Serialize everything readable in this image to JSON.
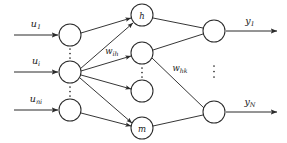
{
  "diagram": {
    "type": "neural-network",
    "stroke_color": "#2b2b2b",
    "text_color": "#1a1a1a",
    "background": "#ffffff"
  },
  "layers": {
    "input": {
      "name": "input-layer",
      "nodes": [
        {
          "id": "in-1",
          "label": "",
          "cx": 70,
          "cy": 35,
          "r": 11
        },
        {
          "id": "in-i",
          "label": "",
          "cx": 70,
          "cy": 72,
          "r": 11
        },
        {
          "id": "in-n",
          "label": "",
          "cx": 70,
          "cy": 110,
          "r": 11
        }
      ],
      "signals": [
        {
          "base": "u",
          "sub": "1",
          "text": "u1",
          "x": 36,
          "y": 24
        },
        {
          "base": "u",
          "sub": "i",
          "text": "ui",
          "x": 36,
          "y": 61
        },
        {
          "base": "u",
          "sub": "ni",
          "text": "uni",
          "x": 36,
          "y": 99
        }
      ],
      "ellipses": [
        {
          "x": 70,
          "y": 53
        },
        {
          "x": 70,
          "y": 91
        }
      ]
    },
    "hidden": {
      "name": "hidden-layer",
      "nodes": [
        {
          "id": "hid-h",
          "label": "h",
          "cx": 142,
          "cy": 15,
          "r": 11
        },
        {
          "id": "hid-2",
          "label": "",
          "cx": 142,
          "cy": 53,
          "r": 11
        },
        {
          "id": "hid-3",
          "label": "",
          "cx": 142,
          "cy": 91,
          "r": 11
        },
        {
          "id": "hid-m",
          "label": "m",
          "cx": 142,
          "cy": 128,
          "r": 11
        }
      ],
      "ellipses": [
        {
          "x": 142,
          "y": 72
        }
      ]
    },
    "output": {
      "name": "output-layer",
      "nodes": [
        {
          "id": "out-1",
          "label": "",
          "cx": 214,
          "cy": 31,
          "r": 11
        },
        {
          "id": "out-N",
          "label": "",
          "cx": 214,
          "cy": 112,
          "r": 11
        }
      ],
      "signals": [
        {
          "base": "y",
          "sub": "1",
          "text": "y1",
          "x": 250,
          "y": 22
        },
        {
          "base": "y",
          "sub": "N",
          "text": "yN",
          "x": 250,
          "y": 100
        }
      ],
      "ellipses": [
        {
          "x": 214,
          "y": 72
        }
      ]
    }
  },
  "weights": [
    {
      "id": "w-ih",
      "base": "w",
      "sub": "ih",
      "text": "wih",
      "x": 112,
      "y": 51
    },
    {
      "id": "w-hk",
      "base": "w",
      "sub": "hk",
      "text": "whk",
      "x": 180,
      "y": 68
    }
  ],
  "input_arrows": [
    {
      "id": "arrow-u1",
      "x1": 14,
      "y1": 35,
      "x2": 58,
      "y2": 35
    },
    {
      "id": "arrow-ui",
      "x1": 14,
      "y1": 72,
      "x2": 58,
      "y2": 72
    },
    {
      "id": "arrow-uni",
      "x1": 14,
      "y1": 110,
      "x2": 58,
      "y2": 110
    }
  ],
  "output_arrows": [
    {
      "id": "arrow-y1",
      "x1": 226,
      "y1": 31,
      "x2": 277,
      "y2": 31
    },
    {
      "id": "arrow-yN",
      "x1": 226,
      "y1": 112,
      "x2": 277,
      "y2": 112
    }
  ],
  "connections": [
    {
      "id": "edge-in1-h",
      "from": "in-1",
      "to": "hid-h",
      "x1": 81,
      "y1": 33,
      "x2": 131,
      "y2": 18,
      "arrow": true
    },
    {
      "id": "edge-ini-h",
      "from": "in-i",
      "to": "hid-h",
      "x1": 80,
      "y1": 69,
      "x2": 133,
      "y2": 22,
      "arrow": true
    },
    {
      "id": "edge-ini-2",
      "from": "in-i",
      "to": "hid-2",
      "x1": 81,
      "y1": 71,
      "x2": 131,
      "y2": 56,
      "arrow": true
    },
    {
      "id": "edge-ini-3",
      "from": "in-i",
      "to": "hid-3",
      "x1": 81,
      "y1": 75,
      "x2": 131,
      "y2": 89,
      "arrow": true
    },
    {
      "id": "edge-ini-m",
      "from": "in-i",
      "to": "hid-m",
      "x1": 80,
      "y1": 78,
      "x2": 132,
      "y2": 124,
      "arrow": true
    },
    {
      "id": "edge-inn-m",
      "from": "in-n",
      "to": "hid-m",
      "x1": 81,
      "y1": 113,
      "x2": 131,
      "y2": 126,
      "arrow": true
    },
    {
      "id": "edge-h-out1",
      "from": "hid-h",
      "to": "out-1",
      "x1": 153,
      "y1": 18,
      "x2": 203,
      "y2": 28,
      "arrow": false
    },
    {
      "id": "edge-2-out1",
      "from": "hid-2",
      "to": "out-1",
      "x1": 153,
      "y1": 50,
      "x2": 203,
      "y2": 34,
      "arrow": false
    },
    {
      "id": "edge-2-outN",
      "from": "hid-2",
      "to": "out-N",
      "x1": 152,
      "y1": 58,
      "x2": 204,
      "y2": 108,
      "arrow": false
    },
    {
      "id": "edge-m-outN",
      "from": "hid-m",
      "to": "out-N",
      "x1": 153,
      "y1": 126,
      "x2": 203,
      "y2": 115,
      "arrow": false
    }
  ]
}
